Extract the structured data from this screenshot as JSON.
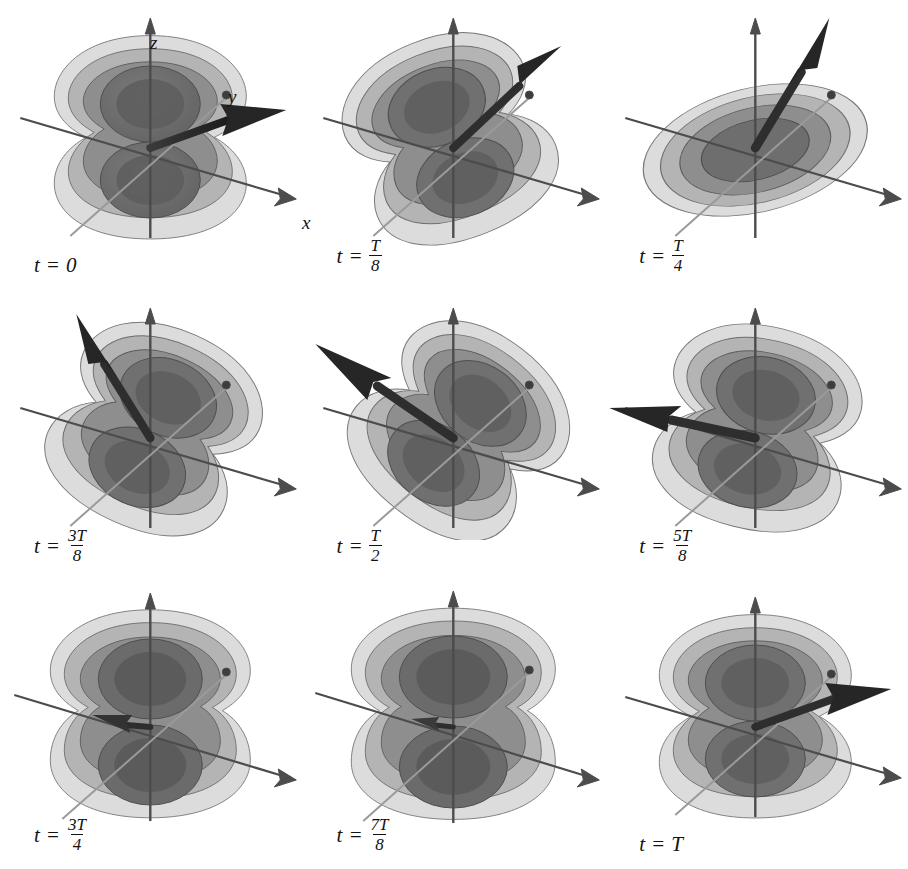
{
  "figure": {
    "type": "3d-isosurface-sequence",
    "rows": 3,
    "cols": 3,
    "background_color": "#ffffff"
  },
  "axes": {
    "x_label": "x",
    "y_label": "y",
    "z_label": "z",
    "shown_in_panel": 1,
    "axis_color": "#4c4c4c"
  },
  "shells": {
    "count": 4,
    "colors": [
      "#dcdcdc",
      "#b4b4b4",
      "#8e8e8e",
      "#6e6e6e"
    ],
    "outline_color": "#5a5a5a"
  },
  "dipole_arrow": {
    "color": "#2b2b2b",
    "name": "dipole-moment-vector"
  },
  "panels": [
    {
      "index": 1,
      "time_prefix": "t",
      "equals": "=",
      "time_value": "0",
      "fraction": null,
      "arrow_angle_deg": 14,
      "arrow_length": 1.0,
      "shape": "dumbbell-vertical"
    },
    {
      "index": 2,
      "time_prefix": "t",
      "equals": "=",
      "time_value": null,
      "fraction": {
        "numerator": "T",
        "denominator": "8"
      },
      "arrow_angle_deg": -40,
      "arrow_length": 0.95,
      "shape": "dumbbell-tilted"
    },
    {
      "index": 3,
      "time_prefix": "t",
      "equals": "=",
      "time_value": null,
      "fraction": {
        "numerator": "T",
        "denominator": "4"
      },
      "arrow_angle_deg": -70,
      "arrow_length": 0.95,
      "shape": "oblate-flattened"
    },
    {
      "index": 4,
      "time_prefix": "t",
      "equals": "=",
      "time_value": null,
      "fraction": {
        "numerator": "3T",
        "denominator": "8"
      },
      "arrow_angle_deg": -105,
      "arrow_length": 0.9,
      "shape": "dumbbell-tilted"
    },
    {
      "index": 5,
      "time_prefix": "t",
      "equals": "=",
      "time_value": null,
      "fraction": {
        "numerator": "T",
        "denominator": "2"
      },
      "arrow_angle_deg": -143,
      "arrow_length": 1.0,
      "shape": "dumbbell-tilted"
    },
    {
      "index": 6,
      "time_prefix": "t",
      "equals": "=",
      "time_value": null,
      "fraction": {
        "numerator": "5T",
        "denominator": "8"
      },
      "arrow_angle_deg": -168,
      "arrow_length": 0.85,
      "shape": "dumbbell-tilted"
    },
    {
      "index": 7,
      "time_prefix": "t",
      "equals": "=",
      "time_value": null,
      "fraction": {
        "numerator": "3T",
        "denominator": "4"
      },
      "arrow_angle_deg": 188,
      "arrow_length": 0.28,
      "shape": "dumbbell-vertical"
    },
    {
      "index": 8,
      "time_prefix": "t",
      "equals": "=",
      "time_value": null,
      "fraction": {
        "numerator": "7T",
        "denominator": "8"
      },
      "arrow_angle_deg": 182,
      "arrow_length": 0.22,
      "shape": "dumbbell-vertical"
    },
    {
      "index": 9,
      "time_prefix": "t",
      "equals": "=",
      "time_value": "T",
      "fraction": null,
      "arrow_angle_deg": 14,
      "arrow_length": 1.0,
      "shape": "dumbbell-vertical"
    }
  ]
}
